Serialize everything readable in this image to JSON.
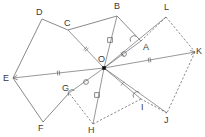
{
  "figure": {
    "background_color": "#ffffff",
    "stroke_color": "#6b6b6b",
    "label_color": "#3a3a3a",
    "center_point_color": "#111111"
  },
  "vertices": [
    {
      "id": "A",
      "label": "A",
      "x": 141,
      "y": 41,
      "label_x": 143,
      "label_y": 43
    },
    {
      "id": "B",
      "label": "B",
      "x": 117,
      "y": 16,
      "label_x": 114,
      "label_y": 2
    },
    {
      "id": "C",
      "label": "C",
      "x": 68,
      "y": 30,
      "label_x": 64,
      "label_y": 19
    },
    {
      "id": "D",
      "label": "D",
      "x": 42,
      "y": 19,
      "label_x": 36,
      "label_y": 8
    },
    {
      "id": "E",
      "label": "E",
      "x": 13,
      "y": 78,
      "label_x": 3,
      "label_y": 74
    },
    {
      "id": "F",
      "label": "F",
      "x": 43,
      "y": 122,
      "label_x": 38,
      "label_y": 124
    },
    {
      "id": "G",
      "label": "G",
      "x": 69,
      "y": 93,
      "label_x": 62,
      "label_y": 84
    },
    {
      "id": "H",
      "label": "H",
      "x": 93,
      "y": 124,
      "label_x": 88,
      "label_y": 126
    },
    {
      "id": "I",
      "label": "I",
      "x": 141,
      "y": 99,
      "label_x": 141,
      "label_y": 103
    },
    {
      "id": "J",
      "label": "J",
      "x": 167,
      "y": 113,
      "label_x": 164,
      "label_y": 116
    },
    {
      "id": "K",
      "label": "K",
      "x": 195,
      "y": 52,
      "label_x": 196,
      "label_y": 47
    },
    {
      "id": "L",
      "label": "L",
      "x": 166,
      "y": 17,
      "label_x": 164,
      "label_y": 3
    },
    {
      "id": "O",
      "label": "O",
      "x": 104,
      "y": 68,
      "label_x": 98,
      "label_y": 55
    }
  ],
  "edges": [
    {
      "name": "edge-B-C",
      "from": "B",
      "to": "C",
      "style": "solid"
    },
    {
      "name": "edge-C-D",
      "from": "C",
      "to": "D",
      "style": "solid"
    },
    {
      "name": "edge-D-E",
      "from": "D",
      "to": "E",
      "style": "solid"
    },
    {
      "name": "edge-E-F",
      "from": "E",
      "to": "F",
      "style": "solid"
    },
    {
      "name": "edge-F-G",
      "from": "F",
      "to": "G",
      "style": "solid"
    },
    {
      "name": "edge-B-A",
      "from": "B",
      "to": "A",
      "style": "solid"
    },
    {
      "name": "edge-A-L",
      "from": "A",
      "to": "L",
      "style": "dashed"
    },
    {
      "name": "edge-L-K",
      "from": "L",
      "to": "K",
      "style": "dashed"
    },
    {
      "name": "edge-K-J",
      "from": "K",
      "to": "J",
      "style": "dashed"
    },
    {
      "name": "edge-J-I",
      "from": "J",
      "to": "I",
      "style": "dashed"
    },
    {
      "name": "edge-I-H",
      "from": "I",
      "to": "H",
      "style": "dashed"
    },
    {
      "name": "edge-H-G",
      "from": "H",
      "to": "G",
      "style": "dashed"
    }
  ],
  "rays": [
    {
      "name": "ray-O-A",
      "from": "O",
      "to": "A",
      "style": "solid",
      "ticks": 1
    },
    {
      "name": "ray-O-B",
      "from": "O",
      "to": "B",
      "style": "solid",
      "ticks": 0
    },
    {
      "name": "ray-O-C",
      "from": "O",
      "to": "C",
      "style": "solid",
      "ticks": 2
    },
    {
      "name": "ray-O-E",
      "from": "O",
      "to": "E",
      "style": "solid",
      "ticks": 2
    },
    {
      "name": "ray-O-G",
      "from": "O",
      "to": "G",
      "style": "solid",
      "ticks": 0
    },
    {
      "name": "ray-O-H",
      "from": "O",
      "to": "H",
      "style": "solid",
      "ticks": 0
    },
    {
      "name": "ray-O-I",
      "from": "O",
      "to": "I",
      "style": "solid",
      "ticks": 1
    },
    {
      "name": "ray-O-K",
      "from": "O",
      "to": "K",
      "style": "solid",
      "ticks": 2
    },
    {
      "name": "ray-O-L",
      "from": "O",
      "to": "L",
      "style": "solid",
      "ticks": 0
    },
    {
      "name": "ray-O-J",
      "from": "O",
      "to": "J",
      "style": "solid",
      "ticks": 0
    }
  ],
  "markers": {
    "square_ticks": [
      {
        "name": "square-tick-OB",
        "x": 110,
        "y": 40
      },
      {
        "name": "square-tick-OH",
        "x": 97,
        "y": 95
      }
    ],
    "circle_ticks": [
      {
        "name": "circle-tick-OA",
        "x": 124,
        "y": 54
      },
      {
        "name": "circle-tick-OG",
        "x": 86,
        "y": 82
      }
    ],
    "angle_arcs": [
      {
        "name": "angle-arc-A",
        "x": 134,
        "y": 39
      },
      {
        "name": "angle-arc-G",
        "x": 72,
        "y": 93
      },
      {
        "name": "angle-arc-I",
        "x": 137,
        "y": 95
      }
    ]
  },
  "arrow_tips": [
    {
      "name": "arrow-tip-K",
      "x": 195,
      "y": 52
    },
    {
      "name": "arrow-tip-E",
      "x": 13,
      "y": 78
    }
  ]
}
